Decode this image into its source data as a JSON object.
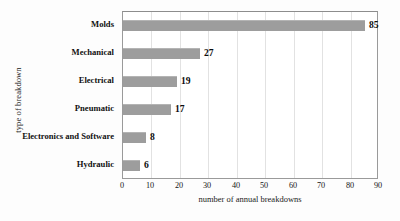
{
  "chart_data": {
    "type": "bar",
    "orientation": "horizontal",
    "title": "",
    "xlabel": "number of annual breakdowns",
    "ylabel": "type of breakdown",
    "categories": [
      "Molds",
      "Mechanical",
      "Electrical",
      "Pneumatic",
      "Electronics and Software",
      "Hydraulic"
    ],
    "values": [
      85,
      27,
      19,
      17,
      8,
      6
    ],
    "value_labels": [
      "85",
      "27",
      "19",
      "17",
      "8",
      "6"
    ],
    "xlim": [
      0,
      90
    ],
    "xticks": [
      0,
      10,
      20,
      30,
      40,
      50,
      60,
      70,
      80,
      90
    ],
    "xtick_labels": [
      "0",
      "10",
      "20",
      "30",
      "40",
      "50",
      "60",
      "70",
      "80",
      "90"
    ],
    "grid": "vertical",
    "legend": "none",
    "bar_color": "#9d9d9d",
    "frame_color": "#9a9a9a",
    "gridline_color": "#e2e2e2",
    "background_color": "#ffffff"
  }
}
